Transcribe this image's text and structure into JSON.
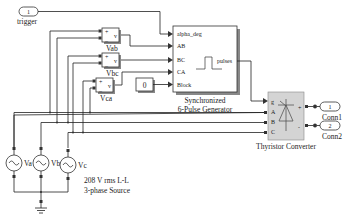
{
  "diagram": {
    "inport": {
      "number": "1",
      "label": "trigger"
    },
    "voltage_measurements": [
      {
        "name": "Vab",
        "plus": "+",
        "minus": "_",
        "out": "v"
      },
      {
        "name": "Vbc",
        "plus": "+",
        "minus": "_",
        "out": "v"
      },
      {
        "name": "Vca",
        "plus": "+",
        "minus": "_",
        "out": "v"
      }
    ],
    "constant": {
      "value": "0"
    },
    "pulse_generator": {
      "name_line1": "Synchronized",
      "name_line2": "6-Pulse Generator",
      "inputs": [
        "alpha_deg",
        "AB",
        "BC",
        "CA",
        "Block"
      ],
      "output": "pulses"
    },
    "converter": {
      "name": "Thyristor Converter",
      "inputs": [
        "g",
        "A",
        "B",
        "C"
      ],
      "outputs": [
        "+",
        "-"
      ]
    },
    "outports": [
      {
        "number": "1",
        "label": "Conn1"
      },
      {
        "number": "2",
        "label": "Conn2"
      }
    ],
    "sources": [
      {
        "name": "Va"
      },
      {
        "name": "Vb"
      },
      {
        "name": "Vc"
      }
    ],
    "source_note_line1": "208  V rms L-L",
    "source_note_line2": "3-phase Source"
  }
}
